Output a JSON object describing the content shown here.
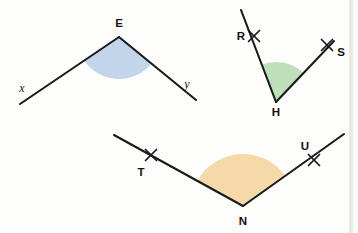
{
  "page": {
    "background_color": "#fdfdfb",
    "width": 358,
    "height": 233
  },
  "style": {
    "line_color": "#1a1a1a",
    "label_color": "#15120f",
    "page_edge_color": "#d8d2c4"
  },
  "figures": [
    {
      "id": "figure-angle-e",
      "name": "angle-xEy",
      "vertex_label": "E",
      "ray_labels": [
        "x",
        "y"
      ],
      "fill_color": "#c3d5e8",
      "arc_stroke_color": "#9db8d4",
      "vertex": {
        "x": 119,
        "y": 37
      },
      "ray_ends": [
        {
          "label": "x",
          "x": 20,
          "y": 104
        },
        {
          "label": "y",
          "x": 196,
          "y": 100
        }
      ],
      "labels": {
        "vertex": {
          "text": "E",
          "x": 119,
          "y": 27
        },
        "ray_x": {
          "text": "x",
          "x": 22,
          "y": 92
        },
        "ray_y": {
          "text": "y",
          "x": 187,
          "y": 88
        }
      },
      "wedge_radius": 42,
      "tick_marks": []
    },
    {
      "id": "figure-angle-h",
      "name": "angle-RHS",
      "vertex_label": "H",
      "ray_labels": [
        "R",
        "S"
      ],
      "fill_color": "#bfdfbb",
      "arc_stroke_color": "#8dc08a",
      "vertex": {
        "x": 276,
        "y": 102
      },
      "ray_ends": [
        {
          "label": "R",
          "x": 241,
          "y": 10
        },
        {
          "label": "S",
          "x": 334,
          "y": 41
        }
      ],
      "labels": {
        "vertex": {
          "text": "H",
          "x": 276,
          "y": 116
        },
        "ray_r": {
          "text": "R",
          "x": 241,
          "y": 39
        },
        "ray_s": {
          "text": "S",
          "x": 340,
          "y": 54
        }
      },
      "wedge_radius": 40,
      "tick_marks": [
        {
          "on_ray": "R",
          "x": 254,
          "y": 36
        },
        {
          "on_ray": "S",
          "x": 327,
          "y": 45
        }
      ]
    },
    {
      "id": "figure-angle-n",
      "name": "angle-TNU",
      "vertex_label": "N",
      "ray_labels": [
        "T",
        "U"
      ],
      "fill_color": "#f6d9a8",
      "arc_stroke_color": "#e0b96f",
      "vertex": {
        "x": 243,
        "y": 206
      },
      "ray_ends": [
        {
          "label": "T",
          "x": 114,
          "y": 135
        },
        {
          "label": "U",
          "x": 344,
          "y": 134
        }
      ],
      "labels": {
        "vertex": {
          "text": "N",
          "x": 243,
          "y": 224
        },
        "ray_t": {
          "text": "T",
          "x": 141,
          "y": 174
        },
        "ray_u": {
          "text": "U",
          "x": 305,
          "y": 150
        }
      },
      "wedge_radius": 52,
      "tick_marks": [
        {
          "on_ray": "T",
          "x": 151,
          "y": 155
        },
        {
          "on_ray": "U",
          "x": 314,
          "y": 160
        }
      ]
    }
  ]
}
